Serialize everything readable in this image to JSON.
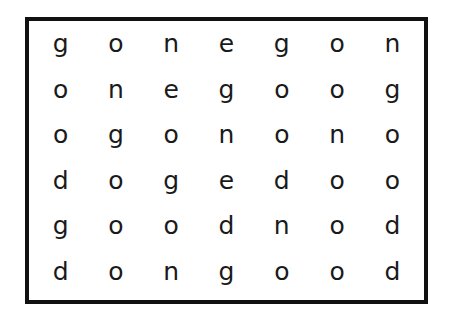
{
  "puzzle": {
    "type": "letter-grid",
    "rows": [
      [
        "g",
        "o",
        "n",
        "e",
        "g",
        "o",
        "n"
      ],
      [
        "o",
        "n",
        "e",
        "g",
        "o",
        "o",
        "g"
      ],
      [
        "o",
        "g",
        "o",
        "n",
        "o",
        "n",
        "o"
      ],
      [
        "d",
        "o",
        "g",
        "e",
        "d",
        "o",
        "o"
      ],
      [
        "g",
        "o",
        "o",
        "d",
        "n",
        "o",
        "d"
      ],
      [
        "d",
        "o",
        "n",
        "g",
        "o",
        "o",
        "d"
      ]
    ]
  },
  "colors": {
    "border": "#111111",
    "text": "#1a1a1a",
    "background": "#ffffff"
  }
}
